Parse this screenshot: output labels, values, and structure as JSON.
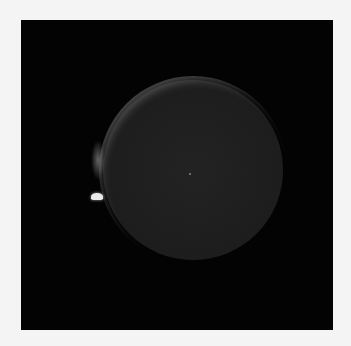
{
  "image": {
    "description": "Dark square image showing a faint glowing circular disk with a brighter rim on the upper-left and small bright specks to its left",
    "colors": {
      "background": "#f4f4f4",
      "frame": "#030303",
      "disk": "#3c3c3c",
      "rim": "#9a9a9a",
      "speck": "#eaeaea"
    }
  }
}
